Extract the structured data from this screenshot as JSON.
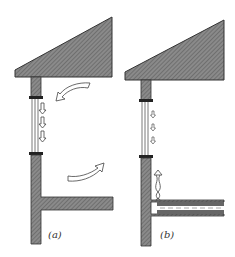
{
  "figure": {
    "panels": [
      {
        "id": "a",
        "label": "(a)",
        "description": "Wall with window; air circulates: cold air descends along glazing, curved arrows show room airflow"
      },
      {
        "id": "b",
        "label": "(b)",
        "description": "Wall with window; cold downdraft arrows along glazing opposed by rising warm air from floor heating duct"
      }
    ],
    "colors": {
      "hatch_fill": "#7a7a7a",
      "outline": "#333333",
      "background": "#ffffff"
    }
  }
}
